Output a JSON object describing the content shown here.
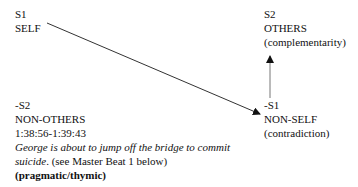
{
  "nodes": {
    "s1": {
      "code": "S1",
      "label": "SELF"
    },
    "s2": {
      "code": "S2",
      "label": "OTHERS",
      "relation": "(complementarity)"
    },
    "neg_s2": {
      "code": "-S2",
      "label": "NON-OTHERS",
      "timecode": "1:38:56-1:39:43",
      "description_italic_1": "George is about to jump off the bridge to commit",
      "description_italic_2": "suicide",
      "description_rest": ". (see Master Beat 1 below)",
      "category": "(pragmatic/thymic)"
    },
    "neg_s1": {
      "code": "-S1",
      "label": "NON-SELF",
      "relation": "(contradiction)"
    }
  },
  "arrows": [
    {
      "from": "S1",
      "to": "-S1",
      "type": "contradiction"
    },
    {
      "from": "-S1",
      "to": "S2",
      "type": "complementarity"
    }
  ]
}
